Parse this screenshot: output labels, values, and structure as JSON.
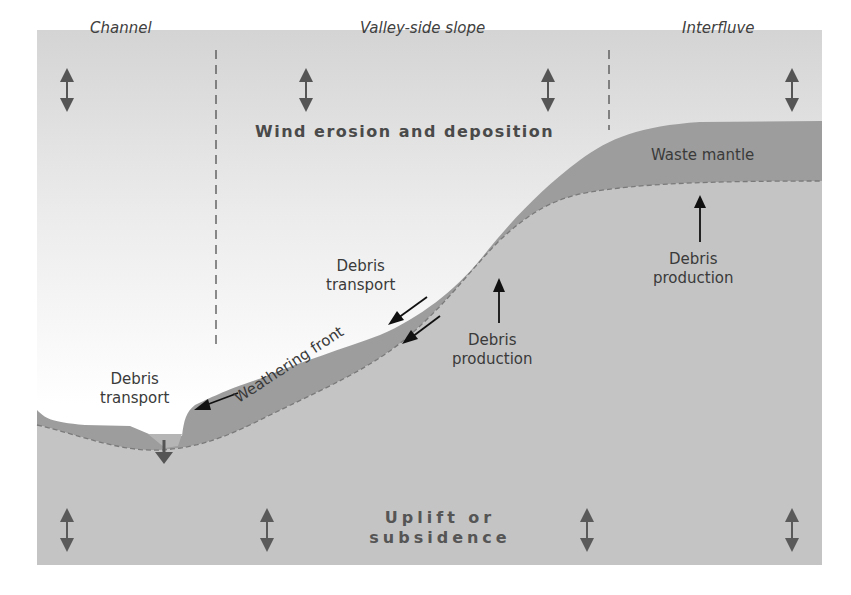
{
  "figure": {
    "zones": [
      {
        "label": "Channel"
      },
      {
        "label": "Valley-side slope"
      },
      {
        "label": "Interfluve"
      }
    ],
    "processes": {
      "top": "Wind erosion and deposition",
      "bottom_line1": "Uplift or",
      "bottom_line2": "subsidence"
    },
    "labels": {
      "waste_mantle": "Waste mantle",
      "weathering_front": "Weathering front",
      "debris_transport_upper": {
        "line1": "Debris",
        "line2": "transport"
      },
      "debris_transport_lower": {
        "line1": "Debris",
        "line2": "transport"
      },
      "debris_production_slope": {
        "line1": "Debris",
        "line2": "production"
      },
      "debris_production_interfluve": {
        "line1": "Debris",
        "line2": "production"
      }
    },
    "colors": {
      "sky_top": "#d6d6d6",
      "sky_bottom": "#ffffff",
      "waste_mantle": "#9d9d9d",
      "bedrock": "#c4c4c4",
      "arrow_gray": "#555555",
      "arrow_black": "#111111",
      "text": "#3a3a3a"
    }
  }
}
